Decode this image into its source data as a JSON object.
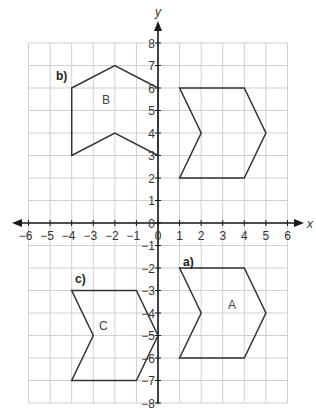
{
  "chart_data": {
    "type": "scatter",
    "title": "",
    "xlabel": "x",
    "ylabel": "y",
    "xlim": [
      -6,
      6
    ],
    "ylim": [
      -8,
      8
    ],
    "grid": true,
    "x_ticks": [
      "-6",
      "-5",
      "-4",
      "-3",
      "-2",
      "-1",
      "0",
      "1",
      "2",
      "3",
      "4",
      "5",
      "6"
    ],
    "y_ticks": [
      "8",
      "7",
      "6",
      "5",
      "4",
      "3",
      "2",
      "1",
      "0",
      "-1",
      "-2",
      "-3",
      "-4",
      "-5",
      "-6",
      "-7",
      "-8"
    ],
    "shapes": [
      {
        "name": "original",
        "label": "",
        "part": "",
        "points": [
          [
            1,
            6
          ],
          [
            4,
            6
          ],
          [
            5,
            4
          ],
          [
            4,
            2
          ],
          [
            1,
            2
          ],
          [
            2,
            4
          ]
        ]
      },
      {
        "name": "A",
        "label": "A",
        "part": "a)",
        "points": [
          [
            1,
            -2
          ],
          [
            4,
            -2
          ],
          [
            5,
            -4
          ],
          [
            4,
            -6
          ],
          [
            1,
            -6
          ],
          [
            2,
            -4
          ]
        ]
      },
      {
        "name": "B",
        "label": "B",
        "part": "b)",
        "points": [
          [
            -4,
            6
          ],
          [
            -2,
            7
          ],
          [
            0,
            6
          ],
          [
            0,
            3
          ],
          [
            -2,
            4
          ],
          [
            -4,
            3
          ]
        ]
      },
      {
        "name": "C",
        "label": "C",
        "part": "c)",
        "points": [
          [
            -4,
            -3
          ],
          [
            -1,
            -3
          ],
          [
            0,
            -5
          ],
          [
            -1,
            -7
          ],
          [
            -4,
            -7
          ],
          [
            -3,
            -5
          ]
        ]
      }
    ]
  },
  "axes": {
    "x_label": "x",
    "y_label": "y"
  },
  "parts": {
    "a": "a)",
    "b": "b)",
    "c": "c)"
  },
  "shape_labels": {
    "A": "A",
    "B": "B",
    "C": "C"
  },
  "colors": {
    "grid": "#cfcfcf",
    "axis": "#1a1a1a",
    "shape": "#333333",
    "text": "#333333"
  }
}
